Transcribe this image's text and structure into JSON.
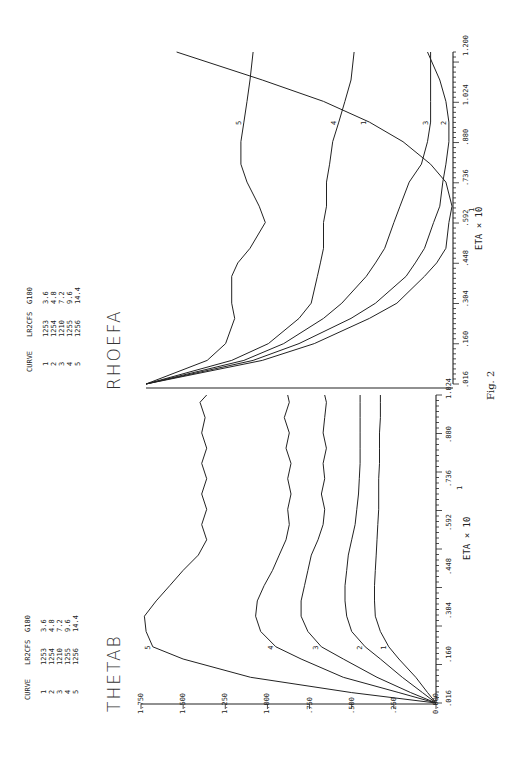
{
  "figure_label": "Fig. 2",
  "chart_data": [
    {
      "type": "line",
      "title": "THETAB",
      "xlabel": "ETA x 10^1",
      "xlabel_text": "ETA × 10",
      "xlabel_exp": "1",
      "ylabel": "THETAB",
      "x_ticks": [
        ".016",
        ".160",
        ".304",
        ".448",
        ".592",
        ".736",
        ".880",
        "1.024"
      ],
      "y_ticks": [
        "0.000",
        ".250",
        ".500",
        ".750",
        "1.000",
        "1.250",
        "1.500",
        "1.750"
      ],
      "xlim": [
        0.016,
        1.024
      ],
      "ylim": [
        0.0,
        1.75
      ],
      "grid": false,
      "legend": {
        "headers": [
          "CURVE",
          "LR2CFS",
          "G180"
        ],
        "rows": [
          [
            "1",
            "1253",
            "3.6"
          ],
          [
            "2",
            "1254",
            "4.8"
          ],
          [
            "3",
            "1210",
            "7.2"
          ],
          [
            "4",
            "1255",
            "9.6"
          ],
          [
            "5",
            "1256",
            "14.4"
          ]
        ]
      },
      "x": [
        0.016,
        0.05,
        0.1,
        0.16,
        0.2,
        0.25,
        0.3,
        0.35,
        0.4,
        0.45,
        0.5,
        0.55,
        0.6,
        0.65,
        0.7,
        0.75,
        0.8,
        0.85,
        0.9,
        0.95,
        1.0,
        1.024
      ],
      "series": [
        {
          "name": "1",
          "values": [
            0.0,
            0.05,
            0.12,
            0.22,
            0.28,
            0.33,
            0.36,
            0.365,
            0.365,
            0.36,
            0.355,
            0.35,
            0.345,
            0.34,
            0.34,
            0.34,
            0.335,
            0.335,
            0.335,
            0.33,
            0.33,
            0.33
          ]
        },
        {
          "name": "2",
          "values": [
            0.0,
            0.08,
            0.2,
            0.33,
            0.42,
            0.5,
            0.53,
            0.54,
            0.54,
            0.53,
            0.52,
            0.5,
            0.48,
            0.47,
            0.46,
            0.455,
            0.45,
            0.45,
            0.45,
            0.45,
            0.45,
            0.45
          ]
        },
        {
          "name": "3",
          "values": [
            0.0,
            0.15,
            0.35,
            0.55,
            0.68,
            0.76,
            0.8,
            0.8,
            0.78,
            0.76,
            0.74,
            0.7,
            0.67,
            0.66,
            0.68,
            0.66,
            0.67,
            0.65,
            0.67,
            0.66,
            0.65,
            0.66
          ]
        },
        {
          "name": "4",
          "values": [
            0.0,
            0.22,
            0.55,
            0.8,
            0.95,
            1.04,
            1.07,
            1.06,
            1.02,
            0.97,
            0.93,
            0.89,
            0.87,
            0.88,
            0.86,
            0.88,
            0.86,
            0.89,
            0.87,
            0.9,
            0.87,
            0.88
          ]
        },
        {
          "name": "5",
          "values": [
            0.0,
            0.5,
            1.1,
            1.5,
            1.68,
            1.72,
            1.73,
            1.66,
            1.58,
            1.5,
            1.41,
            1.36,
            1.39,
            1.36,
            1.39,
            1.36,
            1.39,
            1.36,
            1.39,
            1.37,
            1.4,
            1.36
          ]
        }
      ]
    },
    {
      "type": "line",
      "title": "RHOEFA",
      "xlabel": "ETA x 10^1",
      "xlabel_text": "ETA × 10",
      "xlabel_exp": "1",
      "ylabel": "RHOEFA",
      "x_ticks": [
        ".016",
        ".160",
        ".304",
        ".448",
        ".592",
        ".736",
        ".880",
        "1.024",
        "1.200"
      ],
      "y_ticks": [],
      "xlim": [
        0.016,
        1.2
      ],
      "ylim_relative": [
        0.0,
        1.0
      ],
      "grid": false,
      "legend": {
        "headers": [
          "CURVE",
          "LR2CFS",
          "G180"
        ],
        "rows": [
          [
            "1",
            "1253",
            "3.6"
          ],
          [
            "2",
            "1254",
            "4.8"
          ],
          [
            "3",
            "1210",
            "7.2"
          ],
          [
            "4",
            "1255",
            "9.6"
          ],
          [
            "5",
            "1256",
            "14.4"
          ]
        ]
      },
      "x": [
        0.016,
        0.1,
        0.16,
        0.25,
        0.304,
        0.4,
        0.448,
        0.5,
        0.592,
        0.65,
        0.736,
        0.8,
        0.88,
        0.95,
        1.024,
        1.1,
        1.2
      ],
      "series": [
        {
          "name": "1",
          "values": [
            1.0,
            0.62,
            0.45,
            0.27,
            0.18,
            0.09,
            0.05,
            0.02,
            0.01,
            0.0,
            0.02,
            0.07,
            0.16,
            0.27,
            0.42,
            0.62,
            0.9
          ]
        },
        {
          "name": "2",
          "values": [
            1.0,
            0.65,
            0.5,
            0.33,
            0.25,
            0.15,
            0.12,
            0.09,
            0.06,
            0.04,
            0.03,
            0.02,
            0.01,
            0.01,
            0.02,
            0.04,
            0.08
          ]
        },
        {
          "name": "3",
          "values": [
            1.0,
            0.68,
            0.55,
            0.42,
            0.36,
            0.28,
            0.25,
            0.22,
            0.19,
            0.17,
            0.14,
            0.1,
            0.08,
            0.07,
            0.07,
            0.07,
            0.07
          ]
        },
        {
          "name": "4",
          "values": [
            1.0,
            0.72,
            0.6,
            0.5,
            0.46,
            0.44,
            0.43,
            0.42,
            0.42,
            0.41,
            0.41,
            0.4,
            0.39,
            0.37,
            0.35,
            0.33,
            0.32
          ]
        },
        {
          "name": "5",
          "values": [
            1.0,
            0.8,
            0.74,
            0.71,
            0.72,
            0.72,
            0.7,
            0.66,
            0.61,
            0.63,
            0.67,
            0.69,
            0.69,
            0.68,
            0.67,
            0.66,
            0.65
          ]
        }
      ]
    }
  ]
}
